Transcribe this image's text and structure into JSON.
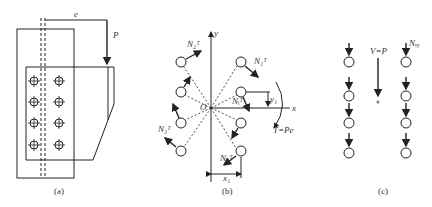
{
  "panel_a": {
    "caption": "(a)",
    "eccentricity_label": "e",
    "load_label": "P",
    "bolt_rows": 4,
    "bolt_cols": 2
  },
  "panel_b": {
    "caption": "(b)",
    "axis_x": "x",
    "axis_y": "y",
    "origin": "O",
    "torque_label": "T=Pe",
    "dim_x": "x₁",
    "dim_y": "y₁",
    "forces": [
      "N₁ᵀ",
      "N₂ᵀ",
      "N₃ᵀ",
      "N₄ᵀ",
      "Nᵢᵀ"
    ],
    "radii": [
      "r₁",
      "r₂",
      "r₃",
      "r₄"
    ]
  },
  "panel_c": {
    "caption": "(c)",
    "shear_label": "V=P",
    "bolt_force_label": "Nᵥᵧ"
  }
}
